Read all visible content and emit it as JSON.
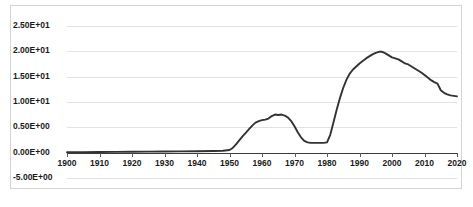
{
  "chart_data": {
    "type": "line",
    "title": "",
    "xlabel": "",
    "ylabel": "",
    "xlim": [
      1900,
      2020
    ],
    "ylim": [
      -5,
      25
    ],
    "grid": true,
    "legend": "none",
    "y_tick_labels": [
      "2.50E+01",
      "2.00E+01",
      "1.50E+01",
      "1.00E+01",
      "0.50E+00",
      "0.00E+00",
      "-5.00E+00"
    ],
    "y_tick_values": [
      25,
      20,
      15,
      10,
      5,
      0,
      -5
    ],
    "x_tick_labels": [
      "1900",
      "1910",
      "1920",
      "1930",
      "1940",
      "1950",
      "1960",
      "1970",
      "1980",
      "1990",
      "2000",
      "2010",
      "2020"
    ],
    "x_tick_values": [
      1900,
      1910,
      1920,
      1930,
      1940,
      1950,
      1960,
      1970,
      1980,
      1990,
      2000,
      2010,
      2020
    ],
    "series": [
      {
        "name": "series-1",
        "color": "#333333",
        "x": [
          1900,
          1905,
          1910,
          1915,
          1920,
          1925,
          1930,
          1935,
          1940,
          1945,
          1948,
          1950,
          1951,
          1952,
          1953,
          1954,
          1955,
          1956,
          1957,
          1958,
          1959,
          1960,
          1961,
          1962,
          1963,
          1964,
          1965,
          1966,
          1967,
          1968,
          1969,
          1970,
          1971,
          1972,
          1973,
          1974,
          1975,
          1976,
          1977,
          1978,
          1979,
          1980,
          1981,
          1982,
          1983,
          1984,
          1985,
          1986,
          1987,
          1988,
          1989,
          1990,
          1991,
          1992,
          1993,
          1994,
          1995,
          1996,
          1997,
          1998,
          1999,
          2000,
          2001,
          2002,
          2003,
          2004,
          2005,
          2006,
          2007,
          2008,
          2009,
          2010,
          2011,
          2012,
          2013,
          2014,
          2015,
          2016,
          2017,
          2018,
          2019,
          2020
        ],
        "y": [
          0.05,
          0.07,
          0.1,
          0.12,
          0.15,
          0.18,
          0.2,
          0.22,
          0.25,
          0.3,
          0.35,
          0.5,
          0.9,
          1.6,
          2.4,
          3.2,
          3.9,
          4.6,
          5.3,
          5.9,
          6.2,
          6.4,
          6.5,
          6.7,
          7.2,
          7.5,
          7.4,
          7.5,
          7.3,
          6.9,
          6.2,
          5.2,
          4.0,
          3.0,
          2.3,
          2.0,
          1.9,
          1.9,
          1.9,
          1.9,
          1.9,
          2.0,
          3.5,
          6.0,
          8.5,
          10.8,
          12.8,
          14.4,
          15.6,
          16.4,
          17.0,
          17.6,
          18.1,
          18.6,
          19.0,
          19.4,
          19.7,
          19.9,
          19.9,
          19.6,
          19.2,
          18.8,
          18.6,
          18.4,
          18.0,
          17.6,
          17.4,
          17.0,
          16.6,
          16.2,
          15.8,
          15.3,
          14.8,
          14.3,
          13.9,
          13.6,
          12.3,
          11.8,
          11.5,
          11.3,
          11.2,
          11.1
        ]
      }
    ]
  }
}
